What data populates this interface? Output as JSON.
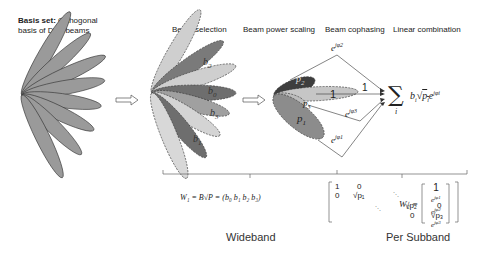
{
  "basis": {
    "title_bold": "Basis set:",
    "title_rest": " Orthogonal",
    "line2": "basis of DFT beams"
  },
  "stages": {
    "selection": "Beam selection",
    "power": "Beam power scaling",
    "cophasing": "Beam cophasing",
    "linear": "Linear combination"
  },
  "beam_labels": {
    "b2": "b",
    "b2sub": "2",
    "b0": "b",
    "b0sub": "0",
    "b3": "b",
    "b3sub": "3",
    "b1": "b",
    "b1sub": "1"
  },
  "power_labels": {
    "p2": "p",
    "p2sub": "2",
    "one": "1",
    "p3": "p",
    "p3sub": "3",
    "p1": "p",
    "p1sub": "1"
  },
  "phases": {
    "e2": "e",
    "e2sup": "jφ2",
    "one": "1",
    "e3": "e",
    "e3sup": "jφ3",
    "e1": "e",
    "e1sup": "jφ1"
  },
  "sum_expr": {
    "sigma": "∑",
    "index": "i",
    "body": "b",
    "bodysub": "i",
    "sqrt": "√",
    "p": "p",
    "psub": "i",
    "e": "e",
    "esup": "jφi"
  },
  "w1": {
    "lhs": "W₁ = B√P = (b₀ b₁ b₂ b₃)",
    "matrix": [
      [
        "1",
        "0",
        "",
        ""
      ],
      [
        "0",
        "√p₁",
        "",
        ""
      ],
      [
        "",
        "",
        "√p₂",
        "0"
      ],
      [
        "",
        "",
        "0",
        "√p₃"
      ]
    ]
  },
  "w2": {
    "lhs": "W₂ =",
    "vector": [
      "1",
      "e^{jφ1}",
      "e^{jφ2}",
      "e^{jφ3}"
    ],
    "v0": "1",
    "v1": "e",
    "v1sup": "jφ1",
    "v2": "e",
    "v2sup": "jφ2",
    "v3": "e",
    "v3sup": "jφ3"
  },
  "bands": {
    "wideband": "Wideband",
    "subband": "Per Subband"
  },
  "colors": {
    "basis_fill": "#9a9a9a",
    "light": "#c8c8c8",
    "mid": "#a8a8a8",
    "dark": "#6e6e6e",
    "darkest": "#4a4a4a"
  }
}
